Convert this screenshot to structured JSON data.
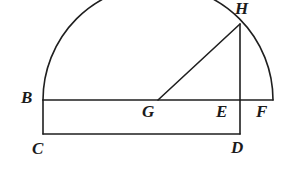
{
  "figure": {
    "kind": "geometry-diagram",
    "stroke_color": "#1f1f1f",
    "background_color": "#ffffff",
    "label_color": "#1b1b1b",
    "stroke_width": 1.6,
    "width": 285,
    "height": 188
  },
  "labels": [
    {
      "id": "B",
      "text": "B",
      "x": 21,
      "y": 89
    },
    {
      "id": "C",
      "text": "C",
      "x": 32,
      "y": 140
    },
    {
      "id": "D",
      "text": "D",
      "x": 231,
      "y": 139
    },
    {
      "id": "E",
      "text": "E",
      "x": 216,
      "y": 103
    },
    {
      "id": "F",
      "text": "F",
      "x": 256,
      "y": 103
    },
    {
      "id": "G",
      "text": "G",
      "x": 142,
      "y": 103
    },
    {
      "id": "H",
      "text": "H",
      "x": 235,
      "y": 0
    }
  ],
  "points": {
    "B": {
      "x": 43,
      "y": 100
    },
    "C": {
      "x": 43,
      "y": 134
    },
    "D": {
      "x": 240,
      "y": 134
    },
    "E": {
      "x": 240,
      "y": 100
    },
    "F": {
      "x": 273,
      "y": 100
    },
    "G": {
      "x": 158,
      "y": 100
    },
    "H": {
      "x": 240,
      "y": 24
    }
  },
  "arc": {
    "name": "semicircle-BF",
    "center_x": 158,
    "center_y": 100,
    "radius": 115,
    "start_x": 43,
    "start_y": 100,
    "end_x": 273,
    "end_y": 100,
    "path": "M 43 100 A 115 115 0 0 1 273 100"
  },
  "segments": [
    {
      "name": "segment-BF",
      "x1": 43,
      "y1": 100,
      "x2": 273,
      "y2": 100
    },
    {
      "name": "segment-BC",
      "x1": 43,
      "y1": 100,
      "x2": 43,
      "y2": 134
    },
    {
      "name": "segment-CD",
      "x1": 43,
      "y1": 134,
      "x2": 240,
      "y2": 134
    },
    {
      "name": "segment-DE",
      "x1": 240,
      "y1": 134,
      "x2": 240,
      "y2": 100
    },
    {
      "name": "segment-EH",
      "x1": 240,
      "y1": 100,
      "x2": 240,
      "y2": 24
    },
    {
      "name": "segment-GH",
      "x1": 158,
      "y1": 100,
      "x2": 240,
      "y2": 24
    }
  ]
}
